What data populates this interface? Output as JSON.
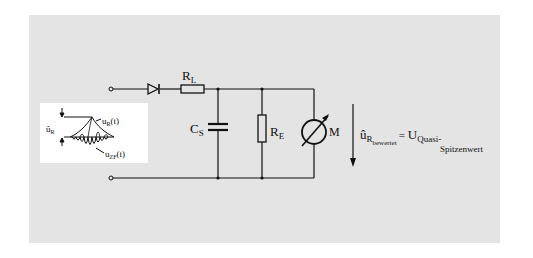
{
  "diagram": {
    "type": "circuit",
    "title": "",
    "components": {
      "resistor_l": {
        "label": "R",
        "sub": "L"
      },
      "capacitor_s": {
        "label": "C",
        "sub": "S"
      },
      "resistor_e": {
        "label": "R",
        "sub": "E"
      },
      "meter": {
        "label": "M"
      },
      "diode": {
        "label": ""
      }
    },
    "inset": {
      "peak_label": "û",
      "peak_sub": "R",
      "envelope_label": "u",
      "envelope_sub": "R",
      "envelope_suffix": "(t)",
      "carrier_label": "u",
      "carrier_sub": "ZF",
      "carrier_suffix": "(t)"
    },
    "output": {
      "symbol": "û",
      "sub": "R",
      "subsub": "bewertet",
      "equals": "=",
      "result": "U",
      "result_sub_line1": "Quasi-",
      "result_sub_line2": "Spitzenwert"
    },
    "colors": {
      "panel": "#e4e4e4",
      "line": "#111111",
      "inset_bg": "#ffffff"
    }
  }
}
